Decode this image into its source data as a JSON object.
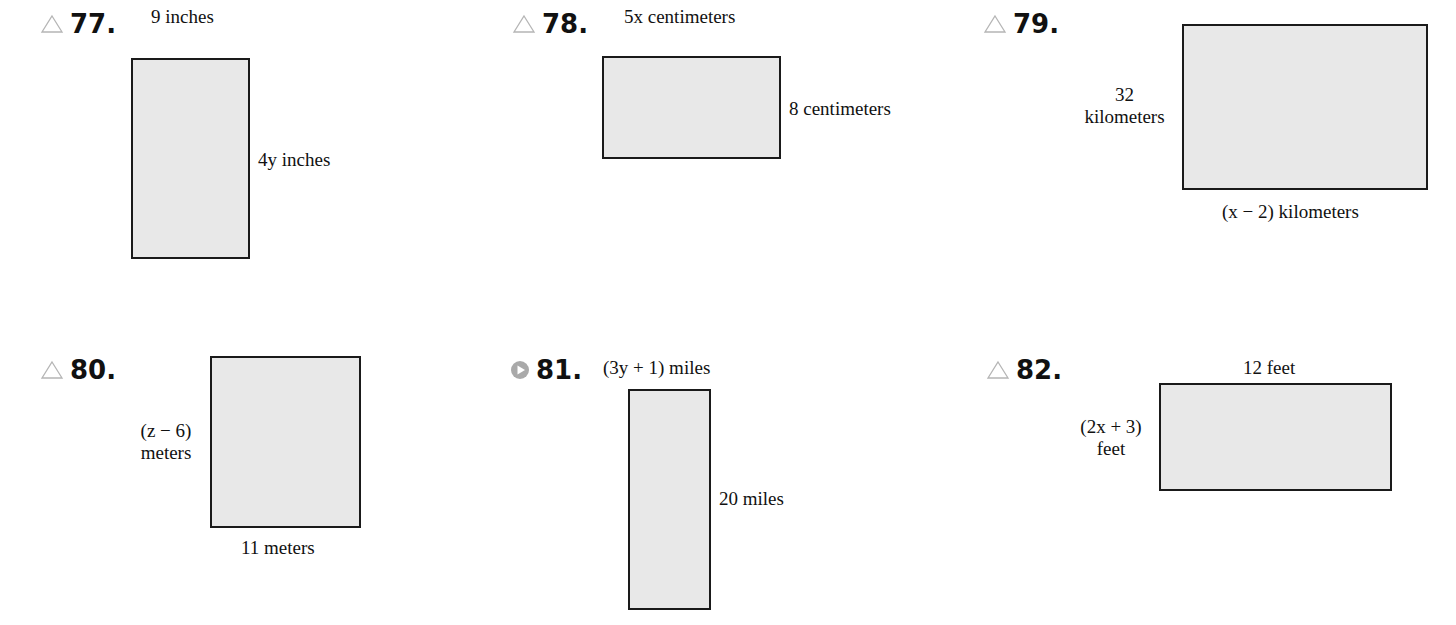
{
  "problems": [
    {
      "number": "77.",
      "marker": "triangle-icon",
      "top_label": "9 inches",
      "side_label": "4y inches"
    },
    {
      "number": "78.",
      "marker": "triangle-icon",
      "top_label": "5x centimeters",
      "side_label": "8 centimeters"
    },
    {
      "number": "79.",
      "marker": "triangle-icon",
      "side_label_line1": "32",
      "side_label_line2": "kilometers",
      "bottom_label": "(x − 2) kilometers"
    },
    {
      "number": "80.",
      "marker": "triangle-icon",
      "side_label_line1": "(z − 6)",
      "side_label_line2": "meters",
      "bottom_label": "11 meters"
    },
    {
      "number": "81.",
      "marker": "video-play-icon",
      "top_label": "(3y + 1) miles",
      "side_label": "20 miles"
    },
    {
      "number": "82.",
      "marker": "triangle-icon",
      "top_label": "12 feet",
      "side_label_line1": "(2x + 3)",
      "side_label_line2": "feet"
    }
  ],
  "colors": {
    "rect_fill": "#e8e8e8",
    "rect_border": "#1a1a1a",
    "marker": "#b5b5b5"
  }
}
